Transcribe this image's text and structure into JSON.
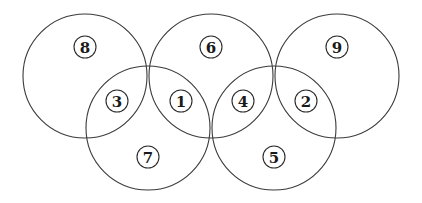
{
  "diagram": {
    "type": "five-overlapping-circles",
    "stroke_color": "#3a3a3a",
    "background": "#ffffff",
    "circles": [
      {
        "id": "top-left",
        "cx": 85,
        "cy": 76,
        "r": 62
      },
      {
        "id": "top-middle",
        "cx": 211,
        "cy": 76,
        "r": 62
      },
      {
        "id": "top-right",
        "cx": 337,
        "cy": 76,
        "r": 62
      },
      {
        "id": "bottom-left",
        "cx": 148,
        "cy": 128,
        "r": 62
      },
      {
        "id": "bottom-right",
        "cx": 274,
        "cy": 128,
        "r": 62
      }
    ],
    "labels": [
      {
        "value": "8",
        "region": "top-left only",
        "x": 85,
        "y": 47
      },
      {
        "value": "6",
        "region": "top-middle only",
        "x": 211,
        "y": 47
      },
      {
        "value": "9",
        "region": "top-right only",
        "x": 337,
        "y": 47
      },
      {
        "value": "3",
        "region": "top-left ∩ bottom-left",
        "x": 117,
        "y": 101
      },
      {
        "value": "1",
        "region": "top-middle ∩ bottom-left",
        "x": 181,
        "y": 101
      },
      {
        "value": "4",
        "region": "top-middle ∩ bottom-right",
        "x": 243,
        "y": 101
      },
      {
        "value": "2",
        "region": "top-right ∩ bottom-right",
        "x": 306,
        "y": 101
      },
      {
        "value": "7",
        "region": "bottom-left only",
        "x": 148,
        "y": 157
      },
      {
        "value": "5",
        "region": "bottom-right only",
        "x": 274,
        "y": 157
      }
    ],
    "badge_radius": 11
  }
}
